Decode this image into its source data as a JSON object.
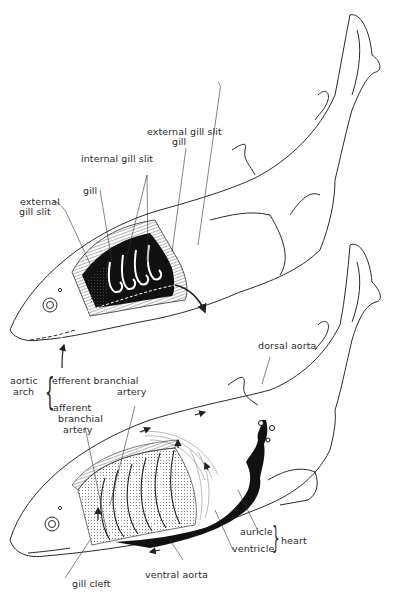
{
  "figure": {
    "top_diagram": {
      "labels": {
        "external_gill_slit_top": "external gill slit",
        "gill_top": "gill",
        "internal_gill_slit": "internal gill slit",
        "gill_left": "gill",
        "external_gill_slit_left_line1": "external",
        "external_gill_slit_left_line2": "gill slit"
      }
    },
    "bottom_diagram": {
      "labels": {
        "dorsal_aorta": "dorsal aorta",
        "aortic_arch_line1": "aortic",
        "aortic_arch_line2": "arch",
        "efferent_line1": "efferent branchial",
        "efferent_line2": "artery",
        "afferent_line1": "afferent",
        "afferent_line2": "branchial",
        "afferent_line3": "artery",
        "auricle": "auricle",
        "ventricle": "ventricle",
        "heart": "heart",
        "gill_cleft": "gill cleft",
        "ventral_aorta": "ventral aorta"
      }
    },
    "colors": {
      "ink": "#2a2a2a",
      "fill_dark": "#111111",
      "background": "#ffffff"
    }
  }
}
